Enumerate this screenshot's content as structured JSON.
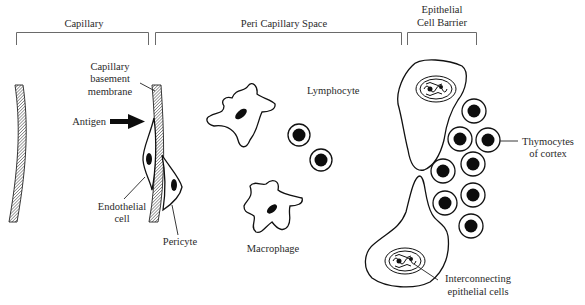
{
  "figure": {
    "sections": [
      {
        "id": "capillary",
        "label": "Capillary"
      },
      {
        "id": "peri-capillary-space",
        "label": "Peri Capillary Space"
      },
      {
        "id": "epithelial-cell-barrier",
        "label_line1": "Epithelial",
        "label_line2": "Cell Barrier"
      }
    ],
    "labels": {
      "basement_line1": "Capillary",
      "basement_line2": "basement",
      "basement_line3": "membrane",
      "antigen": "Antigen",
      "endothelial_line1": "Endothelial",
      "endothelial_line2": "cell",
      "pericyte": "Pericyte",
      "lymphocyte": "Lymphocyte",
      "macrophage": "Macrophage",
      "thymocytes_line1": "Thymocytes",
      "thymocytes_line2": "of cortex",
      "interconnecting_line1": "Interconnecting",
      "interconnecting_line2": "epithelial cells"
    },
    "colors": {
      "ink": "#111111",
      "label": "#2a2a2a",
      "bracket": "#6a6a6a",
      "background": "#ffffff"
    }
  }
}
